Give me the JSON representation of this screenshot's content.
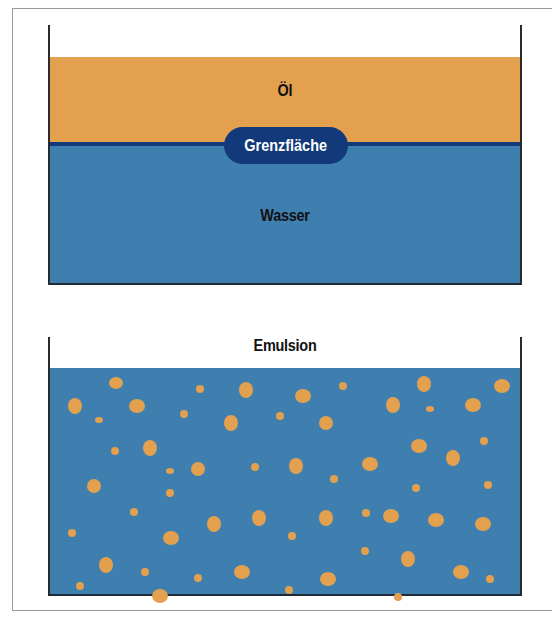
{
  "colors": {
    "oil": "#e3a04f",
    "water": "#3f7fb0",
    "interface": "#12397a",
    "text": "#111111",
    "pill_text": "#ffffff",
    "frame": "#9a9a9a"
  },
  "top_beaker": {
    "oil_label": "Öl",
    "interface_label": "Grenzfläche",
    "water_label": "Wasser"
  },
  "bottom_beaker": {
    "label": "Emulsion",
    "droplets": [
      [
        116,
        383,
        7,
        6
      ],
      [
        200,
        389,
        4,
        4
      ],
      [
        246,
        390,
        7,
        8
      ],
      [
        303,
        396,
        8,
        7
      ],
      [
        343,
        386,
        4,
        4
      ],
      [
        424,
        384,
        7,
        8
      ],
      [
        502,
        386,
        8,
        7
      ],
      [
        75,
        406,
        7,
        8
      ],
      [
        137,
        406,
        8,
        7
      ],
      [
        99,
        420,
        4,
        3
      ],
      [
        184,
        414,
        4,
        4
      ],
      [
        231,
        423,
        7,
        8
      ],
      [
        280,
        416,
        4,
        4
      ],
      [
        326,
        423,
        7,
        7
      ],
      [
        393,
        405,
        7,
        8
      ],
      [
        430,
        409,
        4,
        3
      ],
      [
        473,
        405,
        8,
        7
      ],
      [
        115,
        451,
        4,
        4
      ],
      [
        150,
        448,
        7,
        8
      ],
      [
        419,
        446,
        8,
        7
      ],
      [
        453,
        458,
        7,
        8
      ],
      [
        484,
        441,
        4,
        4
      ],
      [
        94,
        486,
        7,
        7
      ],
      [
        170,
        471,
        4,
        3
      ],
      [
        198,
        469,
        7,
        7
      ],
      [
        255,
        467,
        4,
        4
      ],
      [
        296,
        466,
        7,
        8
      ],
      [
        334,
        479,
        4,
        4
      ],
      [
        370,
        464,
        8,
        7
      ],
      [
        170,
        493,
        4,
        4
      ],
      [
        416,
        488,
        4,
        4
      ],
      [
        488,
        485,
        4,
        4
      ],
      [
        134,
        512,
        4,
        4
      ],
      [
        214,
        524,
        7,
        8
      ],
      [
        259,
        518,
        7,
        8
      ],
      [
        326,
        518,
        7,
        8
      ],
      [
        366,
        513,
        4,
        4
      ],
      [
        391,
        516,
        8,
        7
      ],
      [
        436,
        520,
        8,
        7
      ],
      [
        483,
        524,
        8,
        7
      ],
      [
        72,
        533,
        4,
        4
      ],
      [
        171,
        538,
        8,
        7
      ],
      [
        292,
        536,
        4,
        4
      ],
      [
        365,
        551,
        4,
        4
      ],
      [
        408,
        559,
        7,
        8
      ],
      [
        106,
        565,
        7,
        8
      ],
      [
        145,
        572,
        4,
        4
      ],
      [
        198,
        578,
        4,
        4
      ],
      [
        242,
        572,
        8,
        7
      ],
      [
        328,
        579,
        8,
        7
      ],
      [
        461,
        572,
        8,
        7
      ],
      [
        490,
        579,
        4,
        4
      ],
      [
        80,
        586,
        4,
        4
      ],
      [
        160,
        596,
        8,
        7
      ],
      [
        289,
        590,
        4,
        4
      ],
      [
        398,
        597,
        4,
        4
      ]
    ]
  }
}
